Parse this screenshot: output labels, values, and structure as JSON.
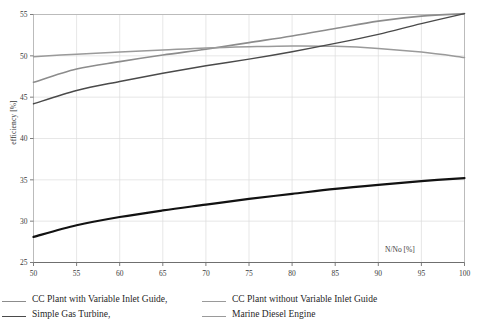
{
  "chart_data": {
    "type": "line",
    "title": "",
    "subtitle": "",
    "xlabel": "N/No  [%]",
    "ylabel": "efficiency  [%]",
    "xlim": [
      50,
      100
    ],
    "ylim": [
      25,
      55
    ],
    "x_ticks": [
      50,
      55,
      60,
      65,
      70,
      75,
      80,
      85,
      90,
      95,
      100
    ],
    "y_ticks": [
      25,
      30,
      35,
      40,
      45,
      50,
      55
    ],
    "grid": true,
    "legend_position": "below-plot",
    "x": [
      50,
      55,
      60,
      65,
      70,
      75,
      80,
      85,
      90,
      95,
      100
    ],
    "series": [
      {
        "name": "CC Plant with Variable Inlet Guide,",
        "color": "#8c8c8c",
        "width": 1.6,
        "values": [
          46.8,
          48.4,
          49.3,
          50.1,
          50.8,
          51.6,
          52.4,
          53.3,
          54.2,
          54.8,
          55.1
        ]
      },
      {
        "name": "CC Plant without Variable Inlet Guide",
        "color": "#9a9a9a",
        "width": 1.5,
        "values": [
          49.9,
          50.2,
          50.45,
          50.7,
          50.95,
          51.1,
          51.2,
          51.15,
          50.9,
          50.45,
          49.8
        ]
      },
      {
        "name": "Simple Gas Turbine,",
        "color": "#4a4a4a",
        "width": 1.4,
        "values": [
          44.2,
          45.8,
          46.9,
          47.9,
          48.8,
          49.6,
          50.5,
          51.5,
          52.6,
          53.9,
          55.1
        ]
      },
      {
        "name": "Marine Diesel Engine",
        "color": "#121212",
        "width": 2.2,
        "values": [
          28.1,
          29.5,
          30.5,
          31.3,
          32.0,
          32.7,
          33.3,
          33.9,
          34.4,
          34.85,
          35.2
        ]
      }
    ]
  },
  "legend": {
    "rows": [
      [
        {
          "label": "CC Plant with Variable Inlet Guide,",
          "color": "#8c8c8c",
          "width": 1.6
        },
        {
          "label": "CC Plant without Variable Inlet Guide",
          "color": "#9a9a9a",
          "width": 1.5
        }
      ],
      [
        {
          "label": "Simple Gas Turbine,",
          "color": "#4a4a4a",
          "width": 1.4
        },
        {
          "label": "Marine Diesel Engine",
          "color": "#9a9a9a",
          "width": 1.5
        }
      ]
    ]
  },
  "axes": {
    "x_title": "N/No  [%]",
    "y_title": "efficiency  [%]"
  },
  "colors": {
    "grid": "#dcdcdc",
    "frame": "#b6b6b6",
    "tick_text": "#3a3a3a",
    "background": "#ffffff"
  }
}
